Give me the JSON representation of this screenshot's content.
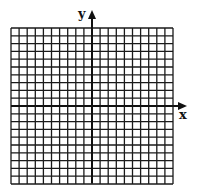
{
  "diagram": {
    "type": "coordinate-grid",
    "columns": 20,
    "rows": 20,
    "x_axis_label": "x",
    "y_axis_label": "y",
    "line_color": "#1a1a1a",
    "background": "#ffffff"
  }
}
